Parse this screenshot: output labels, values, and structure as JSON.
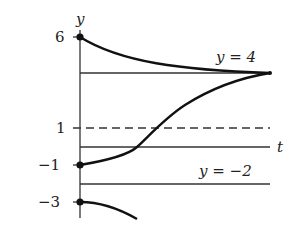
{
  "diagram": {
    "title": "",
    "axes": {
      "vertical_label": "y",
      "horizontal_label": "t"
    },
    "tick_labels": [
      {
        "value": 6,
        "text": "6"
      },
      {
        "value": 1,
        "text": "1"
      },
      {
        "value": -1,
        "text": "−1"
      },
      {
        "value": -3,
        "text": "−3"
      }
    ],
    "equilibrium_lines": [
      {
        "value": 4,
        "label": "y = 4",
        "style": "solid"
      },
      {
        "value": 1,
        "label": "",
        "style": "dashed"
      },
      {
        "value": -2,
        "label": "y = −2",
        "style": "solid"
      }
    ],
    "solution_curves": [
      {
        "initial_value": 6,
        "behavior": "decreases toward y = 4"
      },
      {
        "initial_value": -1,
        "behavior": "increases, crosses y = 1, approaches y = 4"
      },
      {
        "initial_value": -3,
        "behavior": "decreases away from y = -2"
      }
    ],
    "colors": {
      "line": "#222222",
      "background": "#ffffff"
    }
  }
}
